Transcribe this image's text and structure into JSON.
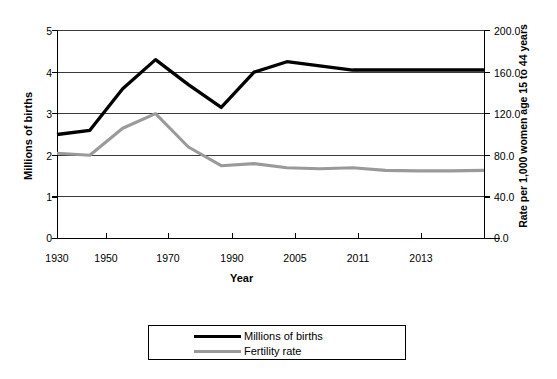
{
  "chart_data": {
    "type": "line",
    "title": "",
    "xlabel": "Year",
    "ylabel": "Millions of births",
    "y2label": "Rate per 1,000 women age 15 to 44 years",
    "grid": true,
    "legend_position": "bottom",
    "categories": [
      "1930",
      "1940",
      "1950",
      "1960",
      "1970",
      "1980",
      "1990",
      "2000",
      "2005",
      "2008",
      "2011",
      "2012",
      "2013",
      "2014"
    ],
    "xtick_labels": [
      "1930",
      "1950",
      "1970",
      "1990",
      "2005",
      "2011",
      "2013"
    ],
    "ylim": [
      0,
      5
    ],
    "ytick_labels": [
      "0",
      "1",
      "2",
      "3",
      "4",
      "5"
    ],
    "y2lim": [
      0,
      200
    ],
    "y2tick_labels": [
      "0.0",
      "40.0",
      "80.0",
      "120.0",
      "160.0",
      "200.0"
    ],
    "series": [
      {
        "name": "Millions of births",
        "axis": "left",
        "color": "#000000",
        "values": [
          2.5,
          2.6,
          3.6,
          4.3,
          3.7,
          3.15,
          4.0,
          4.25,
          4.15,
          4.05,
          4.05,
          4.05,
          4.05,
          4.05
        ]
      },
      {
        "name": "Fertility rate",
        "axis": "right",
        "color": "#9a9a9a",
        "values": [
          82.0,
          80.0,
          106.0,
          120.0,
          88.0,
          70.0,
          72.0,
          68.0,
          67.0,
          68.0,
          65.5,
          65.0,
          65.0,
          65.5
        ]
      }
    ],
    "legend": [
      {
        "label": "Millions of births",
        "color": "#000000"
      },
      {
        "label": "Fertility rate",
        "color": "#9a9a9a"
      }
    ]
  }
}
